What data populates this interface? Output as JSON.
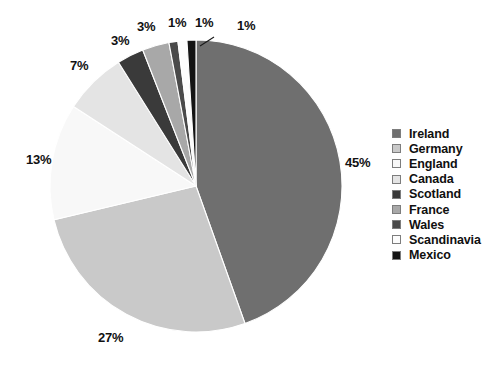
{
  "chart_data": {
    "type": "pie",
    "title": "",
    "legend_position": "right",
    "grid": false,
    "start_angle_deg": 0,
    "direction": "clockwise",
    "categories": [
      "Ireland",
      "Germany",
      "England",
      "Canada",
      "Scotland",
      "France",
      "Wales",
      "Scandinavia",
      "Mexico"
    ],
    "values": [
      45,
      27,
      13,
      7,
      3,
      3,
      1,
      1,
      1
    ],
    "value_labels": [
      "45%",
      "27%",
      "13%",
      "7%",
      "3%",
      "3%",
      "1%",
      "1%",
      "1%"
    ],
    "colors": [
      "#6f6f6f",
      "#c9c9c9",
      "#f8f8f8",
      "#e4e4e4",
      "#3a3a3a",
      "#a8a8a8",
      "#4a4a4a",
      "#fcfcfc",
      "#141414"
    ],
    "units": "percent"
  },
  "legend": {
    "items": [
      {
        "label": "Ireland",
        "color": "#6f6f6f"
      },
      {
        "label": "Germany",
        "color": "#c9c9c9"
      },
      {
        "label": "England",
        "color": "#f8f8f8"
      },
      {
        "label": "Canada",
        "color": "#e4e4e4"
      },
      {
        "label": "Scotland",
        "color": "#3a3a3a"
      },
      {
        "label": "France",
        "color": "#a8a8a8"
      },
      {
        "label": "Wales",
        "color": "#4a4a4a"
      },
      {
        "label": "Scandinavia",
        "color": "#fcfcfc"
      },
      {
        "label": "Mexico",
        "color": "#141414"
      }
    ]
  },
  "labels": {
    "ireland": "45%",
    "germany": "27%",
    "england": "13%",
    "canada": "7%",
    "scotland": "3%",
    "france": "3%",
    "wales": "1%",
    "scandinavia": "1%",
    "mexico": "1%"
  }
}
